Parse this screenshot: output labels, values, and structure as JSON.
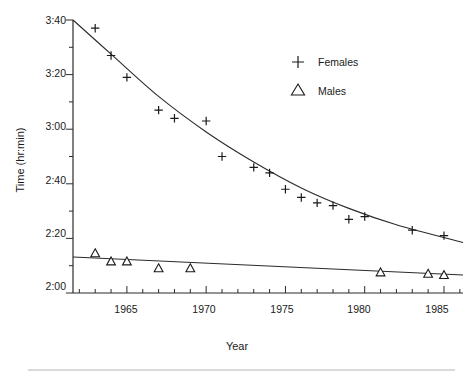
{
  "chart_data": {
    "type": "scatter",
    "title": "",
    "xlabel": "Year",
    "ylabel": "Time (hr:min)",
    "xlim": [
      1961.6,
      1986.2
    ],
    "ylim": [
      120,
      220
    ],
    "grid": false,
    "legend_position": "top-right",
    "y_tick_labels": [
      "3:40",
      "3:20",
      "3:00",
      "2:40",
      "2:20",
      "2:00"
    ],
    "y_tick_values": [
      220,
      200,
      180,
      160,
      140,
      120
    ],
    "y_minor_interval_minutes": 10,
    "x_tick_labels": [
      "1965",
      "1970",
      "1975",
      "1980",
      "1985"
    ],
    "x_tick_values": [
      1965,
      1970,
      1975,
      1980,
      1985
    ],
    "x_minor_interval_years": 1,
    "units_note": "y values are winning times in minutes (hr:min)",
    "series": [
      {
        "name": "Females",
        "marker": "plus",
        "color": "#1a1a1a",
        "points": [
          {
            "x": 1963,
            "y": 217,
            "label": "3:37"
          },
          {
            "x": 1964,
            "y": 207,
            "label": "3:27"
          },
          {
            "x": 1965,
            "y": 199,
            "label": "3:19"
          },
          {
            "x": 1967,
            "y": 187,
            "label": "3:07"
          },
          {
            "x": 1968,
            "y": 184,
            "label": "3:04"
          },
          {
            "x": 1970,
            "y": 183,
            "label": "3:03"
          },
          {
            "x": 1971,
            "y": 170,
            "label": "2:50"
          },
          {
            "x": 1973,
            "y": 166,
            "label": "2:46"
          },
          {
            "x": 1974,
            "y": 164,
            "label": "2:44"
          },
          {
            "x": 1975,
            "y": 158,
            "label": "2:38"
          },
          {
            "x": 1976,
            "y": 155,
            "label": "2:35"
          },
          {
            "x": 1977,
            "y": 153,
            "label": "2:33"
          },
          {
            "x": 1978,
            "y": 152,
            "label": "2:32"
          },
          {
            "x": 1979,
            "y": 147,
            "label": "2:27"
          },
          {
            "x": 1980,
            "y": 148,
            "label": "2:28"
          },
          {
            "x": 1983,
            "y": 143,
            "label": "2:23"
          },
          {
            "x": 1985,
            "y": 141,
            "label": "2:21"
          }
        ],
        "fit": {
          "type": "decaying-curve",
          "description": "smooth decreasing fitted curve for female times",
          "anchor_points": [
            {
              "x": 1961.6,
              "y": 220
            },
            {
              "x": 1964,
              "y": 207.5
            },
            {
              "x": 1967,
              "y": 192
            },
            {
              "x": 1970,
              "y": 179
            },
            {
              "x": 1973,
              "y": 168
            },
            {
              "x": 1976,
              "y": 158.5
            },
            {
              "x": 1979,
              "y": 151
            },
            {
              "x": 1982,
              "y": 145
            },
            {
              "x": 1986.2,
              "y": 138.5
            }
          ]
        }
      },
      {
        "name": "Males",
        "marker": "triangle",
        "color": "#1a1a1a",
        "points": [
          {
            "x": 1963,
            "y": 134.5,
            "label": "2:14"
          },
          {
            "x": 1964,
            "y": 131.5,
            "label": "2:12"
          },
          {
            "x": 1965,
            "y": 131.5,
            "label": "2:12"
          },
          {
            "x": 1967,
            "y": 129,
            "label": "2:09"
          },
          {
            "x": 1969,
            "y": 129,
            "label": "2:09"
          },
          {
            "x": 1981,
            "y": 127.5,
            "label": "2:08"
          },
          {
            "x": 1984,
            "y": 127,
            "label": "2:07"
          },
          {
            "x": 1985,
            "y": 126.5,
            "label": "2:07"
          }
        ],
        "fit": {
          "type": "linear",
          "description": "slight downward linear trend for male times",
          "anchor_points": [
            {
              "x": 1961.6,
              "y": 133.2
            },
            {
              "x": 1986.2,
              "y": 126.6
            }
          ]
        }
      }
    ]
  },
  "legend": {
    "entries": [
      {
        "symbol": "+",
        "label": "Females"
      },
      {
        "symbol": "△",
        "label": "Males"
      }
    ]
  }
}
